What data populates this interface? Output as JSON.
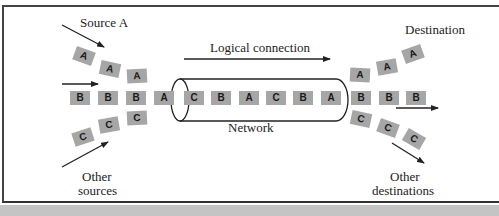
{
  "diagram": {
    "labels": {
      "source_a": "Source A",
      "logical_connection": "Logical connection",
      "destination": "Destination",
      "network": "Network",
      "other_sources": "Other sources",
      "other_sources_line1": "Other",
      "other_sources_line2": "sources",
      "other_destinations_line1": "Other",
      "other_destinations_line2": "destinations"
    },
    "source_a_packets": [
      "A",
      "A",
      "A"
    ],
    "source_b_packets": [
      "B",
      "B",
      "B"
    ],
    "other_source_packets": [
      "C",
      "C",
      "C"
    ],
    "network_packets": [
      "A",
      "C",
      "B",
      "A",
      "C",
      "B",
      "A"
    ],
    "destination_packets": [
      "A",
      "A",
      "A"
    ],
    "destination_b_packets": [
      "B",
      "B",
      "B"
    ],
    "other_destination_packets": [
      "C",
      "C",
      "C"
    ],
    "colors": {
      "packet_fill": "#a6a6a6",
      "line": "#222222",
      "band": "#c4c4c4"
    }
  }
}
